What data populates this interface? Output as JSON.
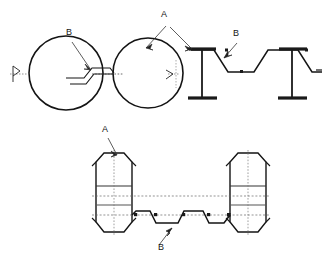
{
  "drawing": {
    "title": "",
    "background_color": "#ffffff",
    "line_color": "#141414",
    "hidden_line_color": "#555555",
    "thick_line_color": "#1a1a1a",
    "views": [
      {
        "name": "top-left-view",
        "description": "two circular hollow sections joined by a corrugated web",
        "labels": [
          "B",
          "A"
        ]
      },
      {
        "name": "top-right-view",
        "description": "two I-beams joined by a trapezoidal corrugated deck profile",
        "labels": [
          "A",
          "B"
        ]
      },
      {
        "name": "bottom-view",
        "description": "elevation of two octagonal sections joined by trapezoidal corrugated deck",
        "labels": [
          "A",
          "B"
        ]
      }
    ],
    "callouts": {
      "a_label": "A",
      "b_label": "B"
    },
    "annotations": [
      {
        "id": "b-top-left",
        "text": "B",
        "x": 69,
        "y": 35
      },
      {
        "id": "a-top-middle",
        "text": "A",
        "x": 164,
        "y": 17
      },
      {
        "id": "b-top-right",
        "text": "B",
        "x": 236,
        "y": 36
      },
      {
        "id": "a-bottom-left",
        "text": "A",
        "x": 105,
        "y": 132
      },
      {
        "id": "b-bottom-mid",
        "text": "B",
        "x": 161,
        "y": 250
      }
    ]
  }
}
